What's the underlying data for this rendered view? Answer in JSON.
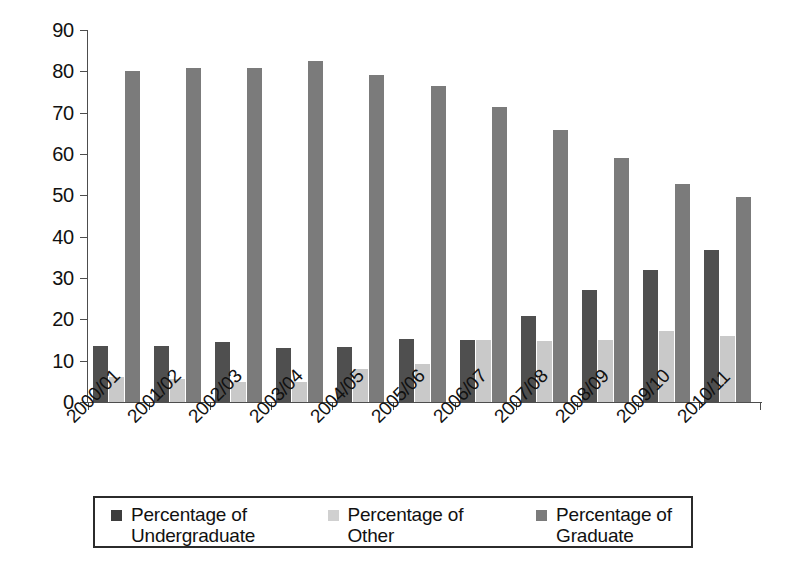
{
  "chart_data": {
    "type": "bar",
    "title": "",
    "xlabel": "",
    "ylabel": "",
    "ylim": [
      0,
      90
    ],
    "y_ticks": [
      0,
      10,
      20,
      30,
      40,
      50,
      60,
      70,
      80,
      90
    ],
    "grid": false,
    "legend_position": "bottom",
    "categories": [
      "2000/01",
      "2001/02",
      "2002/03",
      "2003/04",
      "2004/05",
      "2005/06",
      "2006/07",
      "2007/08",
      "2008/09",
      "2009/10",
      "2010/11"
    ],
    "series": [
      {
        "name": "Percentage of Undergraduate",
        "color": "#4f4f4f",
        "values": [
          13.6,
          13.5,
          14.6,
          13.1,
          13.4,
          15.3,
          15.1,
          20.9,
          27.1,
          31.9,
          36.7
        ]
      },
      {
        "name": "Percentage of Other",
        "color": "#c9c9c9",
        "values": [
          6.1,
          5.5,
          4.9,
          4.9,
          7.9,
          9.2,
          15.0,
          14.7,
          15.1,
          17.2,
          15.9
        ]
      },
      {
        "name": "Percentage of Graduate",
        "color": "#7b7b7b",
        "values": [
          80.1,
          80.7,
          80.9,
          82.4,
          79.2,
          76.4,
          71.4,
          65.8,
          59.0,
          52.7,
          49.6
        ]
      }
    ]
  },
  "legend": {
    "items": [
      {
        "line1": "Percentage of",
        "line2": "Undergraduate"
      },
      {
        "line1": "Percentage of",
        "line2": "Other"
      },
      {
        "line1": "Percentage of",
        "line2": "Graduate"
      }
    ]
  }
}
